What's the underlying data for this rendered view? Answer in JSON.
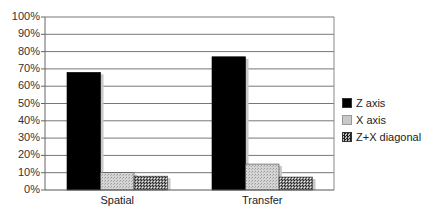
{
  "chart_data": {
    "type": "bar",
    "title": "",
    "xlabel": "",
    "ylabel": "",
    "categories": [
      "Spatial",
      "Transfer"
    ],
    "series": [
      {
        "name": "Z axis",
        "values": [
          68,
          77
        ],
        "color": "#000000",
        "pattern": "solid"
      },
      {
        "name": "X axis",
        "values": [
          10,
          15
        ],
        "color": "#c0c0c0",
        "pattern": "light-stipple"
      },
      {
        "name": "Z+X diagonal",
        "values": [
          8,
          7.5
        ],
        "color": "#555555",
        "pattern": "checker"
      }
    ],
    "ylim": [
      0,
      100
    ],
    "yticks": [
      "0%",
      "10%",
      "20%",
      "30%",
      "40%",
      "50%",
      "60%",
      "70%",
      "80%",
      "90%",
      "100%"
    ],
    "grid": true,
    "legend_position": "right"
  },
  "legend": {
    "items": [
      {
        "label": "Z axis"
      },
      {
        "label": "X axis"
      },
      {
        "label": "Z+X diagonal"
      }
    ]
  }
}
